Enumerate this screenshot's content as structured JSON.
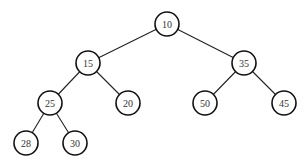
{
  "diagram": {
    "type": "binary-tree",
    "node_radius": 12,
    "colors": {
      "background": "#ffffff",
      "stroke": "#111111",
      "text": "#333333"
    },
    "nodes": [
      {
        "id": "n10",
        "label": "10",
        "x": 167,
        "y": 24
      },
      {
        "id": "n15",
        "label": "15",
        "x": 88,
        "y": 63
      },
      {
        "id": "n35",
        "label": "35",
        "x": 244,
        "y": 63
      },
      {
        "id": "n25",
        "label": "25",
        "x": 50,
        "y": 103
      },
      {
        "id": "n20",
        "label": "20",
        "x": 128,
        "y": 103
      },
      {
        "id": "n50",
        "label": "50",
        "x": 205,
        "y": 103
      },
      {
        "id": "n45",
        "label": "45",
        "x": 284,
        "y": 103
      },
      {
        "id": "n28",
        "label": "28",
        "x": 26,
        "y": 143
      },
      {
        "id": "n30",
        "label": "30",
        "x": 75,
        "y": 143
      }
    ],
    "edges": [
      {
        "from": "n10",
        "to": "n15"
      },
      {
        "from": "n10",
        "to": "n35"
      },
      {
        "from": "n15",
        "to": "n25"
      },
      {
        "from": "n15",
        "to": "n20"
      },
      {
        "from": "n35",
        "to": "n50"
      },
      {
        "from": "n35",
        "to": "n45"
      },
      {
        "from": "n25",
        "to": "n28"
      },
      {
        "from": "n25",
        "to": "n30"
      }
    ]
  }
}
